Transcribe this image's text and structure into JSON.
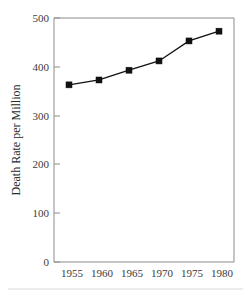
{
  "chart_data": {
    "type": "line",
    "title": "",
    "subtitle": "",
    "xlabel": "",
    "ylabel": "Death Rate per Million",
    "categories": [
      "1955",
      "1960",
      "1965",
      "1970",
      "1975",
      "1980"
    ],
    "x": [
      1955,
      1960,
      1965,
      1970,
      1975,
      1980
    ],
    "values": [
      363,
      373,
      393,
      412,
      453,
      473
    ],
    "series": [
      {
        "name": "Death Rate per Million",
        "values": [
          363,
          373,
          393,
          412,
          453,
          473
        ]
      }
    ],
    "xlim": [
      1952.5,
      1982.5
    ],
    "ylim": [
      0,
      500
    ],
    "ytick_labels": [
      "0",
      "100",
      "200",
      "300",
      "400",
      "500"
    ],
    "ytick_values": [
      0,
      100,
      200,
      300,
      400,
      500
    ],
    "xtick_labels": [
      "1955",
      "1960",
      "1965",
      "1970",
      "1975",
      "1980"
    ],
    "grid": false,
    "legend": false,
    "legend_position": "none",
    "marker": "square",
    "line_color": "#111111",
    "marker_color": "#111111",
    "frame_color": "#8c8c8c",
    "background_color": "#ffffff",
    "annotations": []
  },
  "axes": {
    "y_title": "Death Rate per Million",
    "x_title": ""
  }
}
